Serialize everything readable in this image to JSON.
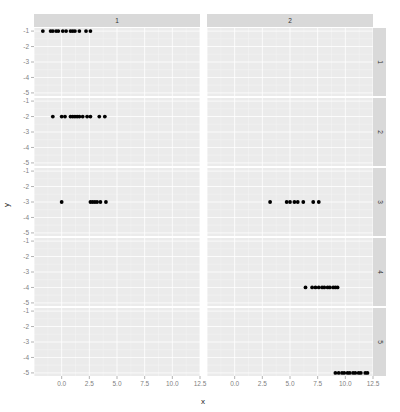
{
  "chart_data": {
    "type": "scatter",
    "title": "",
    "xlabel": "x",
    "ylabel": "y",
    "facet": {
      "cols": [
        "1",
        "2"
      ],
      "rows": [
        "1",
        "2",
        "3",
        "4",
        "5"
      ]
    },
    "xlim": [
      -2.5,
      12.5
    ],
    "ylim": [
      -5.2,
      -0.8
    ],
    "x_ticks": [
      "0.0",
      "2.5",
      "5.0",
      "7.5",
      "10.0",
      "12.5"
    ],
    "x_tick_values": [
      0,
      2.5,
      5,
      7.5,
      10,
      12.5
    ],
    "y_ticks": [
      "-1",
      "-2",
      "-3",
      "-4",
      "-5"
    ],
    "y_tick_values": [
      -1,
      -2,
      -3,
      -4,
      -5
    ],
    "grid": true,
    "legend": "none",
    "panels": [
      {
        "col": "1",
        "row": "1",
        "y": -1,
        "x": [
          -1.7,
          -1.0,
          -0.8,
          -0.5,
          -0.3,
          0.1,
          0.4,
          0.8,
          1.0,
          1.2,
          1.6,
          2.2,
          2.6
        ]
      },
      {
        "col": "2",
        "row": "1",
        "y": -1,
        "x": []
      },
      {
        "col": "1",
        "row": "2",
        "y": -2,
        "x": [
          -0.8,
          0.0,
          0.3,
          0.8,
          1.0,
          1.2,
          1.4,
          1.6,
          1.9,
          2.3,
          2.6,
          3.4,
          3.9
        ]
      },
      {
        "col": "2",
        "row": "2",
        "y": -2,
        "x": []
      },
      {
        "col": "1",
        "row": "3",
        "y": -3,
        "x": [
          0.0,
          2.6,
          2.8,
          3.0,
          3.2,
          3.5,
          4.0
        ]
      },
      {
        "col": "2",
        "row": "3",
        "y": -3,
        "x": [
          3.2,
          4.7,
          5.0,
          5.4,
          5.7,
          6.2,
          7.1,
          7.6
        ]
      },
      {
        "col": "1",
        "row": "4",
        "y": -4,
        "x": []
      },
      {
        "col": "2",
        "row": "4",
        "y": -4,
        "x": [
          6.4,
          7.0,
          7.3,
          7.6,
          7.9,
          8.1,
          8.4,
          8.6,
          8.9,
          9.1,
          9.3
        ]
      },
      {
        "col": "1",
        "row": "5",
        "y": -5,
        "x": []
      },
      {
        "col": "2",
        "row": "5",
        "y": -5,
        "x": [
          9.1,
          9.4,
          9.7,
          9.9,
          10.2,
          10.4,
          10.7,
          10.9,
          11.2,
          11.4,
          11.8,
          12.0
        ]
      }
    ]
  },
  "colors": {
    "panel_bg": "#ebebeb",
    "grid_major": "#ffffff",
    "grid_minor": "#f4f4f4",
    "strip_bg": "#d9d9d9",
    "point": "#000000",
    "tick_text": "#7f7f7f"
  }
}
